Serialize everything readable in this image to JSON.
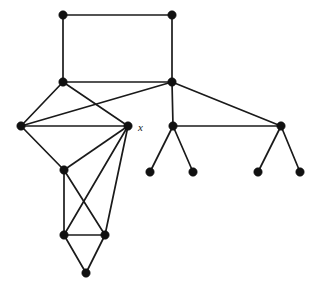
{
  "figure": {
    "name": "undirected-graph-diagram",
    "width": 317,
    "height": 293,
    "background_color": "#ffffff",
    "edge_color": "#1a1a1a",
    "vertex_color": "#111111",
    "vertex_radius": 4.2,
    "edge_width": 1.7
  },
  "labels": [
    {
      "id": "label-x",
      "text": "x",
      "x": 138,
      "y": 131,
      "style": "italic-serif",
      "for_vertex": "v_x"
    }
  ],
  "chart_data": {
    "type": "diagram",
    "subtype": "node-link-graph",
    "title": "",
    "directed": false,
    "weighted": false,
    "vertex_count": 16,
    "edge_count": 22,
    "labeled_vertices": [
      "x"
    ],
    "nodes": [
      {
        "id": "v_tl",
        "label": "",
        "x": 63,
        "y": 15
      },
      {
        "id": "v_tr",
        "label": "",
        "x": 172,
        "y": 15
      },
      {
        "id": "v_bl",
        "label": "",
        "x": 63,
        "y": 82
      },
      {
        "id": "v_br",
        "label": "",
        "x": 172,
        "y": 82
      },
      {
        "id": "v_left",
        "label": "",
        "x": 21,
        "y": 126
      },
      {
        "id": "v_x",
        "label": "x",
        "x": 128,
        "y": 126
      },
      {
        "id": "v_mid",
        "label": "",
        "x": 64,
        "y": 170
      },
      {
        "id": "v_triL",
        "label": "",
        "x": 64,
        "y": 235
      },
      {
        "id": "v_triR",
        "label": "",
        "x": 105,
        "y": 235
      },
      {
        "id": "v_bot",
        "label": "",
        "x": 86,
        "y": 273
      },
      {
        "id": "v_r1",
        "label": "",
        "x": 173,
        "y": 126
      },
      {
        "id": "v_r1a",
        "label": "",
        "x": 150,
        "y": 172
      },
      {
        "id": "v_r1b",
        "label": "",
        "x": 193,
        "y": 172
      },
      {
        "id": "v_r2",
        "label": "",
        "x": 281,
        "y": 126
      },
      {
        "id": "v_r2a",
        "label": "",
        "x": 258,
        "y": 172
      },
      {
        "id": "v_r2b",
        "label": "",
        "x": 300,
        "y": 172
      }
    ],
    "edges": [
      {
        "source": "v_tl",
        "target": "v_tr"
      },
      {
        "source": "v_tl",
        "target": "v_bl"
      },
      {
        "source": "v_tr",
        "target": "v_br"
      },
      {
        "source": "v_bl",
        "target": "v_br"
      },
      {
        "source": "v_bl",
        "target": "v_left"
      },
      {
        "source": "v_bl",
        "target": "v_x"
      },
      {
        "source": "v_br",
        "target": "v_left"
      },
      {
        "source": "v_br",
        "target": "v_r1"
      },
      {
        "source": "v_br",
        "target": "v_r2"
      },
      {
        "source": "v_left",
        "target": "v_x"
      },
      {
        "source": "v_left",
        "target": "v_mid"
      },
      {
        "source": "v_x",
        "target": "v_mid"
      },
      {
        "source": "v_x",
        "target": "v_triL"
      },
      {
        "source": "v_x",
        "target": "v_triR"
      },
      {
        "source": "v_mid",
        "target": "v_triL"
      },
      {
        "source": "v_mid",
        "target": "v_triR"
      },
      {
        "source": "v_triL",
        "target": "v_triR"
      },
      {
        "source": "v_triL",
        "target": "v_bot"
      },
      {
        "source": "v_triR",
        "target": "v_bot"
      },
      {
        "source": "v_r1",
        "target": "v_r1a"
      },
      {
        "source": "v_r1",
        "target": "v_r1b"
      },
      {
        "source": "v_r1",
        "target": "v_r2"
      },
      {
        "source": "v_r2",
        "target": "v_r2a"
      },
      {
        "source": "v_r2",
        "target": "v_r2b"
      }
    ]
  }
}
